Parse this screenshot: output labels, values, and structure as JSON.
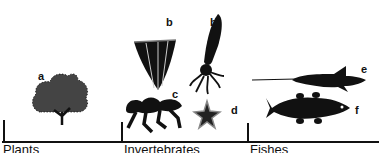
{
  "figure": {
    "labels": {
      "a": "a",
      "b1": "b",
      "b2": "b",
      "c": "c",
      "d": "d",
      "e": "e",
      "f": "f"
    },
    "groups": [
      {
        "name": "Plants"
      },
      {
        "name": "Invertebrates"
      },
      {
        "name": "Fishes"
      }
    ],
    "organisms": [
      {
        "id": "a",
        "icon": "shrub-icon"
      },
      {
        "id": "b",
        "icon": "conulariid-icon"
      },
      {
        "id": "b",
        "icon": "squid-icon"
      },
      {
        "id": "c",
        "icon": "trilobite-arthropod-icon"
      },
      {
        "id": "d",
        "icon": "starfish-icon"
      },
      {
        "id": "e",
        "icon": "armored-fish-icon"
      },
      {
        "id": "f",
        "icon": "lobe-finned-fish-icon"
      }
    ]
  }
}
